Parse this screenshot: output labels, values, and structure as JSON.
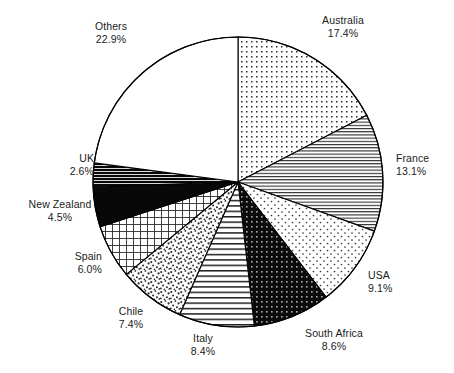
{
  "chart_data": {
    "type": "pie",
    "title": "",
    "subtitle": "",
    "xlabel": "",
    "ylabel": "",
    "legend_position": "none",
    "labels_on_slices": false,
    "value_unit": "%",
    "start_angle_deg": 90,
    "direction": "clockwise",
    "categories": [
      "Australia",
      "France",
      "USA",
      "South Africa",
      "Italy",
      "Chile",
      "Spain",
      "New Zealand",
      "UK",
      "Others"
    ],
    "values": [
      17.4,
      13.1,
      9.1,
      8.6,
      8.4,
      7.4,
      6.0,
      4.5,
      2.6,
      22.9
    ],
    "total": 100.0,
    "slices": [
      {
        "label": "Australia",
        "value": 17.4,
        "value_text": "17.4%",
        "fill": "fine-dots",
        "stroke": "#000000"
      },
      {
        "label": "France",
        "value": 13.1,
        "value_text": "13.1%",
        "fill": "dense-hlines",
        "stroke": "#000000"
      },
      {
        "label": "USA",
        "value": 9.1,
        "value_text": "9.1%",
        "fill": "sparse-dots",
        "stroke": "#000000"
      },
      {
        "label": "South Africa",
        "value": 8.6,
        "value_text": "8.6%",
        "fill": "black-white-dots",
        "stroke": "#000000"
      },
      {
        "label": "Italy",
        "value": 8.4,
        "value_text": "8.4%",
        "fill": "wide-hlines",
        "stroke": "#000000"
      },
      {
        "label": "Chile",
        "value": 7.4,
        "value_text": "7.4%",
        "fill": "coarse-stipple",
        "stroke": "#000000"
      },
      {
        "label": "Spain",
        "value": 6.0,
        "value_text": "6.0%",
        "fill": "crosshatch-grid",
        "stroke": "#000000"
      },
      {
        "label": "New Zealand",
        "value": 4.5,
        "value_text": "4.5%",
        "fill": "solid-black",
        "stroke": "#000000"
      },
      {
        "label": "UK",
        "value": 2.6,
        "value_text": "2.6%",
        "fill": "black-hlines",
        "stroke": "#000000"
      },
      {
        "label": "Others",
        "value": 22.9,
        "value_text": "22.9%",
        "fill": "white",
        "stroke": "#000000"
      }
    ]
  },
  "labels": {
    "australia": {
      "name": "Australia",
      "pct": "17.4%"
    },
    "france": {
      "name": "France",
      "pct": "13.1%"
    },
    "usa": {
      "name": "USA",
      "pct": "9.1%"
    },
    "south_africa": {
      "name": "South Africa",
      "pct": "8.6%"
    },
    "italy": {
      "name": "Italy",
      "pct": "8.4%"
    },
    "chile": {
      "name": "Chile",
      "pct": "7.4%"
    },
    "spain": {
      "name": "Spain",
      "pct": "6.0%"
    },
    "new_zealand": {
      "name": "New Zealand",
      "pct": "4.5%"
    },
    "uk": {
      "name": "UK",
      "pct": "2.6%"
    },
    "others": {
      "name": "Others",
      "pct": "22.9%"
    }
  },
  "colors": {
    "stroke": "#000000",
    "background": "#ffffff",
    "text": "#1b1b1b"
  }
}
